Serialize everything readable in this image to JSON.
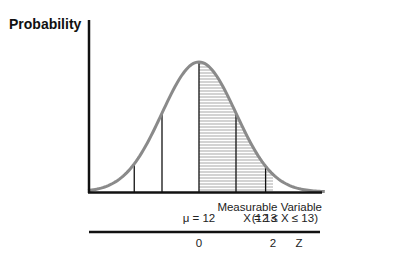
{
  "chart_data": {
    "type": "area",
    "title": "",
    "ylabel": "Probability",
    "xlabel": "Measurable Variable",
    "xlabel_range": "(12 ≤ X ≤ 13)",
    "distribution": "normal",
    "mean": 12,
    "mean_label": "μ = 12",
    "x_marker_label": "X = 13",
    "curve_color": "#8a8a8a",
    "shade_color": "#b8b8b8",
    "shaded_region_z": [
      0,
      2
    ],
    "vertical_lines_z": [
      -1.75,
      -1.0,
      0,
      1.0,
      1.8
    ],
    "z_axis": {
      "label": "Z",
      "ticks": [
        {
          "z": 0,
          "label": "0"
        },
        {
          "z": 2,
          "label": "2"
        }
      ]
    },
    "z_range": [
      -3.0,
      3.4
    ]
  }
}
